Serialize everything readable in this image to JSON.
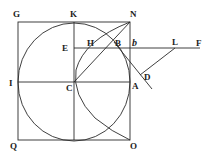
{
  "diagram": {
    "type": "geometric-figure",
    "labels": {
      "G": "G",
      "K": "K",
      "N": "N",
      "E": "E",
      "H": "H",
      "B": "B",
      "b": "b",
      "L": "L",
      "F": "F",
      "I": "I",
      "C": "C",
      "A": "A",
      "D": "D",
      "Q": "Q",
      "O": "O"
    },
    "elements": [
      "square GNOQ",
      "circle centered at C inscribed in square",
      "vertical line KC through center",
      "horizontal line IA through center",
      "horizontal line EF through H, B, b, L",
      "curve from N through H, C to O",
      "line CN",
      "line from B through D",
      "line LD"
    ]
  }
}
